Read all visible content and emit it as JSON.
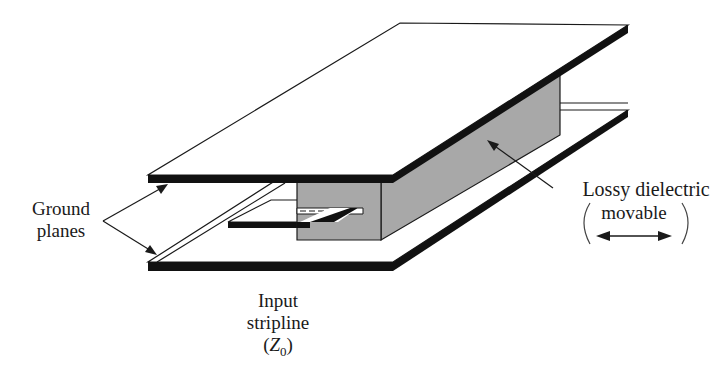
{
  "figure": {
    "labels": {
      "ground_planes": [
        "Ground",
        "planes"
      ],
      "input_stripline": [
        "Input",
        "stripline"
      ],
      "input_impedance": {
        "open": "(",
        "symbol": "Z",
        "subscript": "0",
        "close": ")"
      },
      "lossy_dielectric": "Lossy dielectric",
      "movable": "movable",
      "movable_arrow": "left-right-arrow"
    },
    "colors": {
      "background": "#ffffff",
      "plate_edge": "#111111",
      "plate_face": "#ffffff",
      "dielectric_fill": "#a8a8a8",
      "line": "#1a1a1a"
    },
    "components": [
      "top-ground-plane",
      "bottom-ground-plane",
      "center-strip-conductor",
      "lossy-dielectric-block"
    ]
  }
}
